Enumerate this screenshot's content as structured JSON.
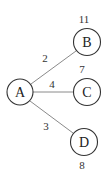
{
  "diagram": {
    "type": "weighted-graph",
    "nodes": [
      {
        "id": "A",
        "label": "A",
        "x": 20,
        "y": 92
      },
      {
        "id": "B",
        "label": "B",
        "x": 87,
        "y": 42,
        "value": "11"
      },
      {
        "id": "C",
        "label": "C",
        "x": 87,
        "y": 92,
        "value": "7"
      },
      {
        "id": "D",
        "label": "D",
        "x": 84,
        "y": 142,
        "value": "8"
      }
    ],
    "edges": [
      {
        "from": "A",
        "to": "B",
        "weight": "2"
      },
      {
        "from": "A",
        "to": "C",
        "weight": "4"
      },
      {
        "from": "A",
        "to": "D",
        "weight": "3"
      }
    ],
    "colors": {
      "node_stroke": "#333333",
      "edge_stroke": "#8a8a8a",
      "text": "#222222",
      "background": "#ffffff"
    }
  }
}
